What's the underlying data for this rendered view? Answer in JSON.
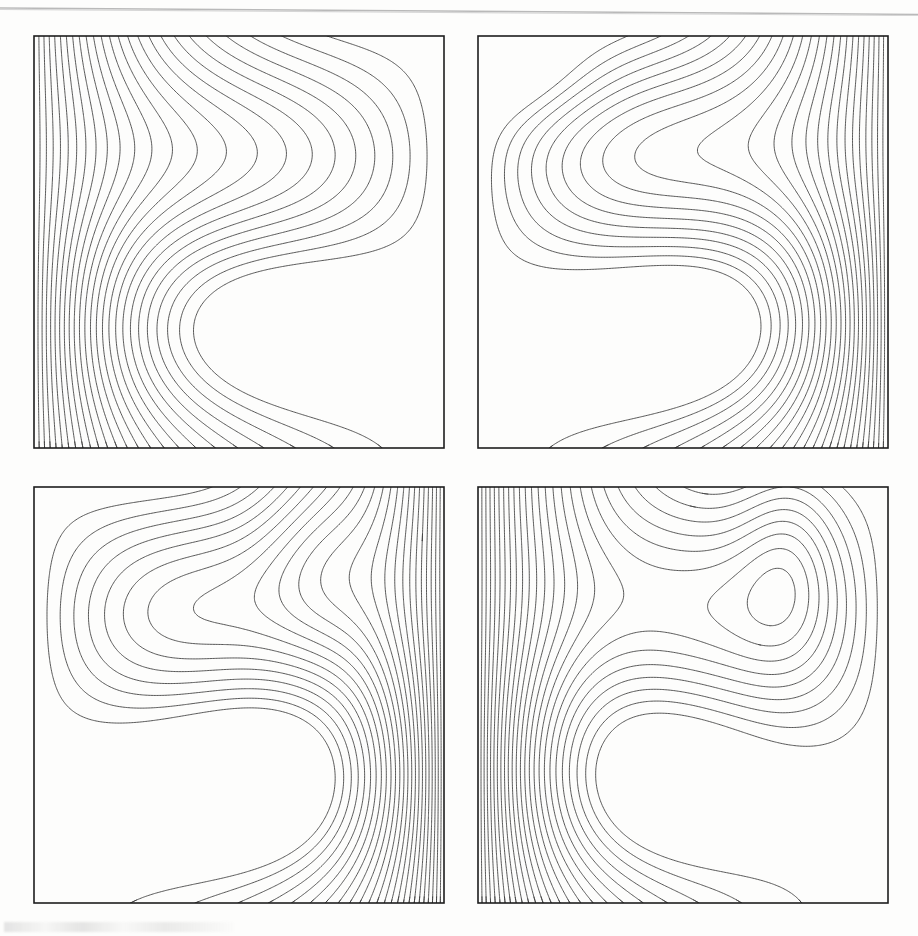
{
  "figure": {
    "title": "",
    "caption": "",
    "background_color": "#fdfdfc",
    "line_color": "#3a3a3a",
    "frame_color": "#1d1d1d",
    "layout": "2x2 grid of contour (isotherm) panels",
    "width_px": 918,
    "height_px": 936
  },
  "artifacts": {
    "top_scan_line_label": "scan-edge-line",
    "bottom_smudge_label": "page-smudge"
  },
  "panels": [
    {
      "id": "panel-a",
      "position": "top-left",
      "label": "",
      "box": {
        "x": 34,
        "y": 36,
        "w": 410,
        "h": 412
      },
      "crowded_edge": "left",
      "description": "Isotherms crowded along the left wall, sweeping in an S-shaped diagonal band toward the lower right; no closed cells."
    },
    {
      "id": "panel-b",
      "position": "top-right",
      "label": "",
      "box": {
        "x": 478,
        "y": 36,
        "w": 410,
        "h": 412
      },
      "crowded_edge": "right",
      "description": "Dense isotherms along the right wall, a small closed cell in the upper-left corner and a secondary tongue near the top-centre-right; broad S-shaped band across the interior."
    },
    {
      "id": "panel-c",
      "position": "bottom-left",
      "label": "",
      "box": {
        "x": 34,
        "y": 487,
        "w": 410,
        "h": 416
      },
      "crowded_edge": "right",
      "description": "Very dense isotherms packed against the right wall, a downward tongue near the top-centre-right, diagonal band running from lower-left to upper-right."
    },
    {
      "id": "panel-d",
      "position": "bottom-right",
      "label": "",
      "box": {
        "x": 478,
        "y": 487,
        "w": 410,
        "h": 416
      },
      "crowded_edge": "left",
      "description": "Dense isotherms packed against the left wall, a pronounced narrow downward tongue in the upper-right quadrant and sinuous isotherms across the centre."
    }
  ],
  "chart_data": {
    "type": "line",
    "subtype": "contour",
    "title": "",
    "xlabel": "",
    "ylabel": "",
    "grid": false,
    "legend": "none",
    "axis_ticks": "none",
    "xlim": [
      0,
      1
    ],
    "ylim": [
      0,
      1
    ],
    "contour_levels": [
      0.04,
      0.08,
      0.12,
      0.16,
      0.2,
      0.24,
      0.28,
      0.32,
      0.36,
      0.4,
      0.44,
      0.48,
      0.52,
      0.56,
      0.6,
      0.64,
      0.68,
      0.72,
      0.76,
      0.8,
      0.84,
      0.88,
      0.92,
      0.96
    ],
    "level_count": 24,
    "panels": [
      {
        "name": "panel-a",
        "position": "top-left",
        "field_params": {
          "base": "left-to-right",
          "boundary_layer_edge": "left",
          "boundary_layer_strength": 3.2,
          "swirl_amplitude": 0.26,
          "swirl_cells": 1,
          "secondary_amplitude": 0.05,
          "tongue": null
        }
      },
      {
        "name": "panel-b",
        "position": "top-right",
        "field_params": {
          "base": "right-to-left",
          "boundary_layer_edge": "right",
          "boundary_layer_strength": 3.6,
          "swirl_amplitude": 0.3,
          "swirl_cells": 1,
          "secondary_amplitude": 0.14,
          "tongue": {
            "cx": 0.12,
            "cy": 0.9,
            "amp": 0.1,
            "sx": 0.13,
            "sy": 0.09
          }
        }
      },
      {
        "name": "panel-c",
        "position": "bottom-left",
        "field_params": {
          "base": "right-to-left",
          "boundary_layer_edge": "right",
          "boundary_layer_strength": 4.6,
          "swirl_amplitude": 0.28,
          "swirl_cells": 1,
          "secondary_amplitude": 0.16,
          "tongue": {
            "cx": 0.7,
            "cy": 0.84,
            "amp": -0.13,
            "sx": 0.11,
            "sy": 0.17
          }
        }
      },
      {
        "name": "panel-d",
        "position": "bottom-right",
        "field_params": {
          "base": "left-to-right",
          "boundary_layer_edge": "left",
          "boundary_layer_strength": 4.2,
          "swirl_amplitude": 0.24,
          "swirl_cells": 1,
          "secondary_amplitude": 0.2,
          "tongue": {
            "cx": 0.76,
            "cy": 0.86,
            "amp": -0.15,
            "sx": 0.09,
            "sy": 0.19
          }
        }
      }
    ]
  }
}
